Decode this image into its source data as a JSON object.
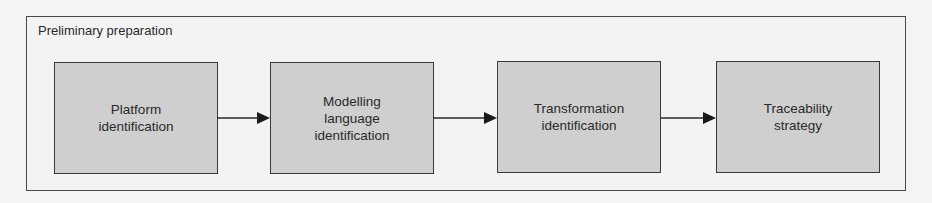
{
  "diagram": {
    "group_title": "Preliminary preparation",
    "steps": [
      {
        "label": "Platform identification",
        "lines": [
          "Platform",
          "identification"
        ]
      },
      {
        "label": "Modelling language identification",
        "lines": [
          "Modelling",
          "language",
          "identification"
        ]
      },
      {
        "label": "Transformation identification",
        "lines": [
          "Transformation",
          "identification"
        ]
      },
      {
        "label": "Traceability strategy",
        "lines": [
          "Traceability",
          "strategy"
        ]
      }
    ],
    "edges": [
      {
        "from": "Platform identification",
        "to": "Modelling language identification"
      },
      {
        "from": "Modelling language identification",
        "to": "Transformation identification"
      },
      {
        "from": "Transformation identification",
        "to": "Traceability strategy"
      }
    ],
    "colors": {
      "box_fill": "#cfcfcf",
      "border": "#3a3a3a",
      "background": "#f3f3f3"
    }
  }
}
